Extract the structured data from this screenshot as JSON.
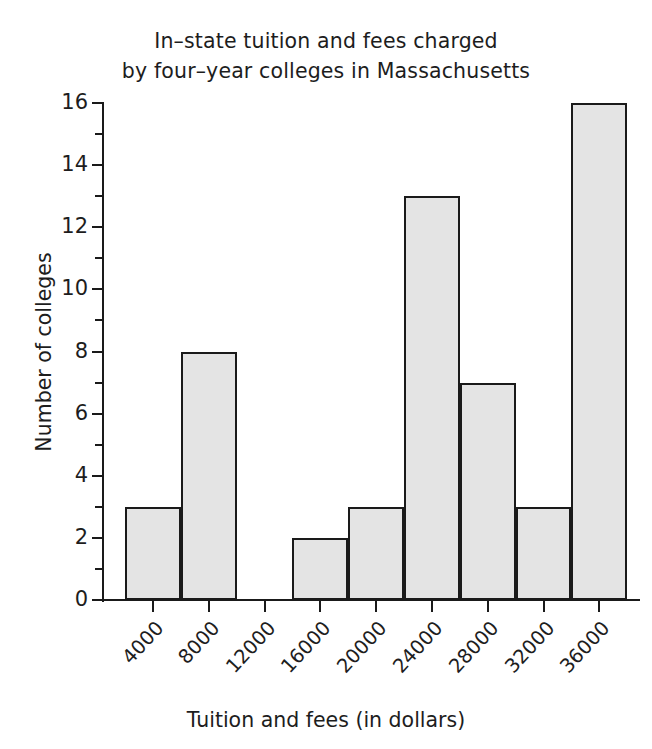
{
  "clipped_top_text": "",
  "chart_data": {
    "type": "bar",
    "title_lines": [
      "In–state tuition and fees charged",
      "by four–year colleges in Massachusetts"
    ],
    "xlabel": "Tuition and fees (in dollars)",
    "ylabel": "Number of colleges",
    "categories": [
      "4000",
      "8000",
      "12000",
      "16000",
      "20000",
      "24000",
      "28000",
      "32000",
      "36000"
    ],
    "values": [
      3,
      8,
      0,
      2,
      3,
      13,
      7,
      3,
      16
    ],
    "ylim": [
      0,
      16
    ],
    "y_major_ticks": [
      0,
      2,
      4,
      6,
      8,
      10,
      12,
      14,
      16
    ],
    "y_major_tick_labels": [
      "0",
      "2",
      "4",
      "6",
      "8",
      "10",
      "12",
      "14",
      "16"
    ],
    "y_minor_ticks": [
      1,
      3,
      5,
      7,
      9,
      11,
      13,
      15
    ],
    "grid": false,
    "legend": null,
    "bar_fill_color": "#e4e4e4",
    "bar_edge_color": "#1a1a1a",
    "axis_color": "#1a1a1a",
    "background_color": "#ffffff",
    "x_tick_label_rotation": -47,
    "bars_adjacent": true
  }
}
